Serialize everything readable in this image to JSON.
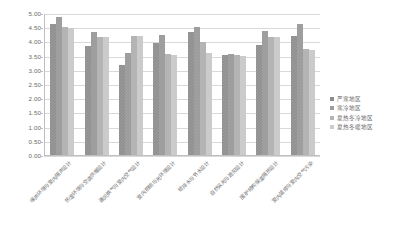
{
  "chart_data": {
    "type": "bar",
    "title": "",
    "xlabel": "",
    "ylabel": "",
    "ylim": [
      0.0,
      5.0
    ],
    "ytick_step": 0.5,
    "grid": true,
    "legend_position": "right",
    "ytick_labels": [
      "5.00",
      "4.50",
      "4.00",
      "3.50",
      "3.00",
      "2.50",
      "2.00",
      "1.50",
      "1.00",
      "0.50",
      "0.00"
    ],
    "ytick_values": [
      5.0,
      4.5,
      4.0,
      3.5,
      3.0,
      2.5,
      2.0,
      1.5,
      1.0,
      0.5,
      0.0
    ],
    "categories": [
      "噪声环境与室内隔声设计",
      "热湿环境与空调供暖设计",
      "通风换气与室内空气设计",
      "室内照明与光环境设计",
      "给排水与节水设计",
      "自然采光与遮阳设计",
      "围护结构保温隔热设计",
      "室内装修与室内空气污染"
    ],
    "series": [
      {
        "name": "严寒地区",
        "values": [
          4.63,
          3.83,
          3.17,
          3.95,
          4.33,
          3.53,
          3.88,
          4.2
        ]
      },
      {
        "name": "寒冷地区",
        "values": [
          4.85,
          4.33,
          3.6,
          4.22,
          4.52,
          3.55,
          4.38,
          4.62
        ]
      },
      {
        "name": "夏热冬冷地区",
        "values": [
          4.5,
          4.17,
          4.18,
          3.55,
          3.98,
          3.52,
          4.17,
          3.72
        ]
      },
      {
        "name": "夏热冬暖地区",
        "values": [
          4.47,
          4.15,
          4.2,
          3.53,
          3.6,
          3.5,
          4.15,
          3.7
        ]
      }
    ],
    "series_colors": [
      "#8c8c8c",
      "#9e9e9e",
      "#b4b4b4",
      "#cbcbcb"
    ]
  }
}
